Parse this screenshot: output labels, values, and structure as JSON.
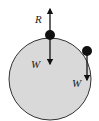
{
  "diagram": {
    "type": "free-body-diagram",
    "surface": {
      "shape": "circle",
      "fill": "#d9d9d9",
      "stroke": "#333333"
    },
    "objects": [
      {
        "name": "ball-top",
        "position": "top of circle",
        "forces": [
          {
            "label": "R",
            "direction": "up"
          },
          {
            "label": "W",
            "direction": "down"
          }
        ]
      },
      {
        "name": "ball-side",
        "position": "right side of circle",
        "forces": [
          {
            "label": "W",
            "direction": "down"
          }
        ]
      }
    ],
    "labels": {
      "reaction_top": "R",
      "weight_top": "W",
      "weight_side": "W"
    }
  }
}
